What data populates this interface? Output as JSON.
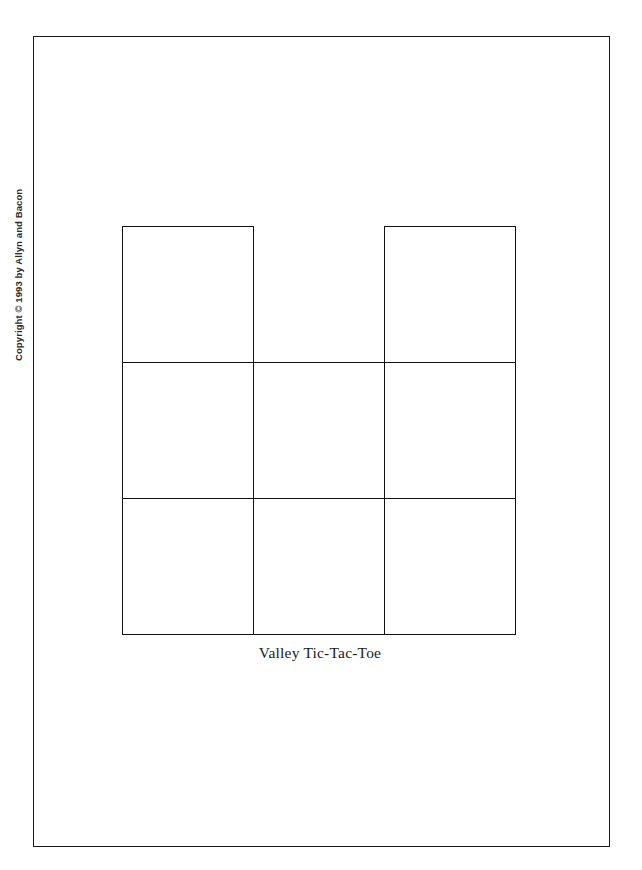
{
  "page": {
    "background_color": "#ffffff",
    "border_color": "#1a1a1a",
    "ink_color": "#111111"
  },
  "copyright": {
    "text": "Copyright © 1993 by Allyn and Bacon",
    "orientation": "vertical-bottom-to-top"
  },
  "figure": {
    "caption": "Valley Tic-Tac-Toe",
    "grid": {
      "columns": 3,
      "rows": 3,
      "cells": [
        {
          "row": 0,
          "col": 0,
          "present": true,
          "label": ""
        },
        {
          "row": 0,
          "col": 1,
          "present": false,
          "label": ""
        },
        {
          "row": 0,
          "col": 2,
          "present": true,
          "label": ""
        },
        {
          "row": 1,
          "col": 0,
          "present": true,
          "label": ""
        },
        {
          "row": 1,
          "col": 1,
          "present": true,
          "label": ""
        },
        {
          "row": 1,
          "col": 2,
          "present": true,
          "label": ""
        },
        {
          "row": 2,
          "col": 0,
          "present": true,
          "label": ""
        },
        {
          "row": 2,
          "col": 1,
          "present": true,
          "label": ""
        },
        {
          "row": 2,
          "col": 2,
          "present": true,
          "label": ""
        }
      ]
    }
  }
}
